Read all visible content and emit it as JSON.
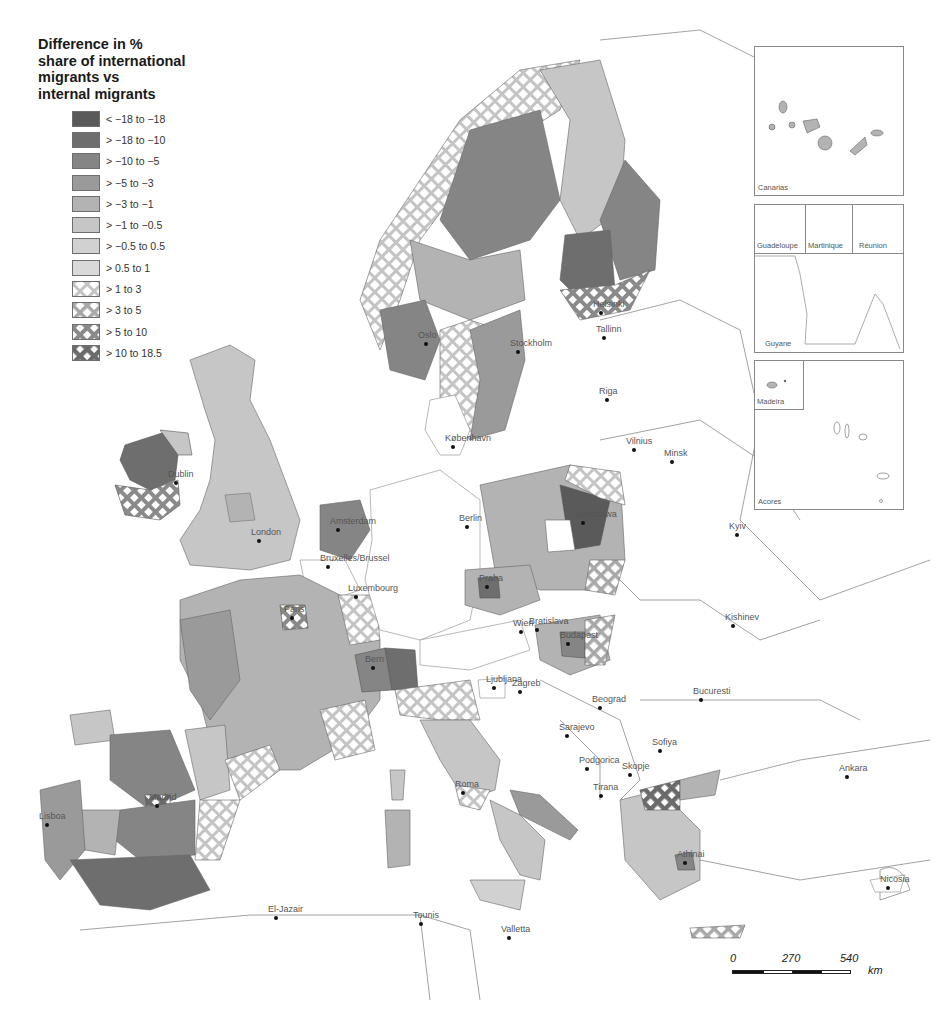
{
  "legend": {
    "title": "Difference in %\nshare of international\nmigrants vs\ninternal migrants",
    "items": [
      {
        "label": "< −18 to −18",
        "color": "#5a5a5a",
        "pattern": "solid"
      },
      {
        "label": "> −18 to −10",
        "color": "#6e6e6e",
        "pattern": "solid"
      },
      {
        "label": "> −10 to −5",
        "color": "#858585",
        "pattern": "solid"
      },
      {
        "label": "> −5 to −3",
        "color": "#9a9a9a",
        "pattern": "solid"
      },
      {
        "label": "> −3 to −1",
        "color": "#b3b3b3",
        "pattern": "solid"
      },
      {
        "label": "> −1 to −0.5",
        "color": "#c6c6c6",
        "pattern": "solid"
      },
      {
        "label": "> −0.5 to 0.5",
        "color": "#d1d1d1",
        "pattern": "solid"
      },
      {
        "label": "> 0.5 to 1",
        "color": "#d9d9d9",
        "pattern": "solid"
      },
      {
        "label": "> 1 to 3",
        "color": "#c9c9c9",
        "pattern": "hatch"
      },
      {
        "label": "> 3 to 5",
        "color": "#a9a9a9",
        "pattern": "hatch"
      },
      {
        "label": "> 5 to 10",
        "color": "#8a8a8a",
        "pattern": "hatch"
      },
      {
        "label": "> 10 to 18.5",
        "color": "#6a6a6a",
        "pattern": "hatch"
      }
    ]
  },
  "insets": [
    {
      "label": "Canarias"
    },
    {
      "label": "Guadeloupe"
    },
    {
      "label": "Martinique"
    },
    {
      "label": "Réunion"
    },
    {
      "label": "Guyane"
    },
    {
      "label": "Madeira"
    },
    {
      "label": "Acores"
    }
  ],
  "cities": [
    {
      "name": "Dublin",
      "x": 176,
      "y": 483
    },
    {
      "name": "London",
      "x": 259,
      "y": 541
    },
    {
      "name": "Amsterdam",
      "x": 338,
      "y": 530
    },
    {
      "name": "Bruxelles/Brussel",
      "x": 328,
      "y": 567
    },
    {
      "name": "Luxembourg",
      "x": 356,
      "y": 597
    },
    {
      "name": "Paris",
      "x": 292,
      "y": 618
    },
    {
      "name": "Bern",
      "x": 373,
      "y": 668
    },
    {
      "name": "Madrid",
      "x": 157,
      "y": 806
    },
    {
      "name": "Lisboa",
      "x": 47,
      "y": 825
    },
    {
      "name": "Oslo",
      "x": 426,
      "y": 344
    },
    {
      "name": "Stockholm",
      "x": 518,
      "y": 352
    },
    {
      "name": "Helsinki",
      "x": 601,
      "y": 313
    },
    {
      "name": "Tallinn",
      "x": 604,
      "y": 338
    },
    {
      "name": "Riga",
      "x": 607,
      "y": 400
    },
    {
      "name": "Vilnius",
      "x": 634,
      "y": 450
    },
    {
      "name": "Minsk",
      "x": 672,
      "y": 462
    },
    {
      "name": "København",
      "x": 453,
      "y": 447
    },
    {
      "name": "Berlin",
      "x": 467,
      "y": 527
    },
    {
      "name": "Warszawa",
      "x": 583,
      "y": 523
    },
    {
      "name": "Praha",
      "x": 487,
      "y": 587
    },
    {
      "name": "Wien",
      "x": 521,
      "y": 632
    },
    {
      "name": "Bratislava",
      "x": 537,
      "y": 630
    },
    {
      "name": "Budapest",
      "x": 568,
      "y": 644
    },
    {
      "name": "Kyiv",
      "x": 737,
      "y": 535
    },
    {
      "name": "Kishinev",
      "x": 733,
      "y": 626
    },
    {
      "name": "Ljubljana",
      "x": 494,
      "y": 688
    },
    {
      "name": "Zagreb",
      "x": 520,
      "y": 692
    },
    {
      "name": "Beograd",
      "x": 600,
      "y": 708
    },
    {
      "name": "Bucuresti",
      "x": 701,
      "y": 700
    },
    {
      "name": "Sarajevo",
      "x": 567,
      "y": 736
    },
    {
      "name": "Sofiya",
      "x": 660,
      "y": 751
    },
    {
      "name": "Podgorica",
      "x": 587,
      "y": 769
    },
    {
      "name": "Skopje",
      "x": 630,
      "y": 775
    },
    {
      "name": "Tirana",
      "x": 601,
      "y": 796
    },
    {
      "name": "Roma",
      "x": 463,
      "y": 793
    },
    {
      "name": "Athinai",
      "x": 685,
      "y": 863
    },
    {
      "name": "Ankara",
      "x": 847,
      "y": 777
    },
    {
      "name": "Nicosia",
      "x": 888,
      "y": 888
    },
    {
      "name": "El-Jazair",
      "x": 276,
      "y": 918
    },
    {
      "name": "Tounis",
      "x": 421,
      "y": 924
    },
    {
      "name": "Valletta",
      "x": 509,
      "y": 938
    }
  ],
  "scalebar": {
    "ticks": [
      "0",
      "270",
      "540"
    ],
    "unit": "km"
  }
}
